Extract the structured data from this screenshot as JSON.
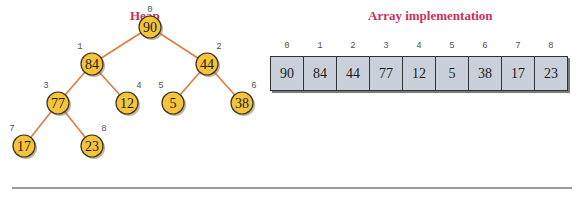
{
  "heap": {
    "title": "Heap",
    "nodes": [
      {
        "index": "0",
        "value": "90",
        "x": 90,
        "y": 53
      },
      {
        "index": "1",
        "value": "84",
        "x": 92,
        "y": 96
      },
      {
        "index": "2",
        "value": "44",
        "x": 207,
        "y": 96
      },
      {
        "index": "3",
        "value": "77",
        "x": 58,
        "y": 134
      },
      {
        "index": "4",
        "value": "12",
        "x": 127,
        "y": 134
      },
      {
        "index": "5",
        "value": "5",
        "x": 173,
        "y": 134
      },
      {
        "index": "6",
        "value": "38",
        "x": 242,
        "y": 134
      },
      {
        "index": "7",
        "value": "17",
        "x": 24,
        "y": 172
      },
      {
        "index": "8",
        "value": "23",
        "x": 92,
        "y": 172
      }
    ]
  },
  "array": {
    "title": "Array implementation",
    "cells": [
      {
        "index": "0",
        "value": "90"
      },
      {
        "index": "1",
        "value": "84"
      },
      {
        "index": "2",
        "value": "44"
      },
      {
        "index": "3",
        "value": "77"
      },
      {
        "index": "4",
        "value": "12"
      },
      {
        "index": "5",
        "value": "5"
      },
      {
        "index": "6",
        "value": "38"
      },
      {
        "index": "7",
        "value": "17"
      },
      {
        "index": "8",
        "value": "23"
      }
    ]
  },
  "colors": {
    "title": "#c8325a",
    "node_fill": "#f6c43a",
    "edge": "#e07a40",
    "cell_fill": "#c9d0da"
  }
}
